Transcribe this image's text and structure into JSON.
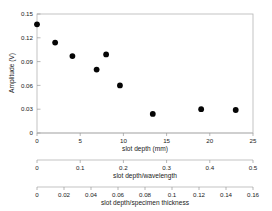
{
  "chart_data": {
    "type": "scatter",
    "title": "",
    "xlabel": "slot depth (mm)",
    "ylabel": "Amplitude (V)",
    "xlim": [
      0,
      25
    ],
    "ylim": [
      0,
      0.15
    ],
    "grid": false,
    "legend": null,
    "marker": "filled-circle",
    "marker_color": "#050505",
    "x": [
      0,
      2.1,
      4.1,
      6.9,
      8.0,
      9.6,
      13.4,
      19.0,
      23.0
    ],
    "values": [
      0.137,
      0.114,
      0.097,
      0.08,
      0.099,
      0.06,
      0.024,
      0.03,
      0.029
    ],
    "points": [
      {
        "x": 0,
        "y": 0.137
      },
      {
        "x": 2.1,
        "y": 0.114
      },
      {
        "x": 4.1,
        "y": 0.097
      },
      {
        "x": 6.9,
        "y": 0.08
      },
      {
        "x": 8.0,
        "y": 0.099
      },
      {
        "x": 9.6,
        "y": 0.06
      },
      {
        "x": 13.4,
        "y": 0.024
      },
      {
        "x": 19.0,
        "y": 0.03
      },
      {
        "x": 23.0,
        "y": 0.029
      }
    ],
    "y_ticks": [
      0,
      0.03,
      0.06,
      0.09,
      0.12,
      0.15
    ],
    "y_tick_labels": [
      "0",
      "0.03",
      "0.06",
      "0.09",
      "0.12",
      "0.15"
    ],
    "axes": [
      {
        "name": "slot-depth-mm",
        "label": "slot depth (mm)",
        "min": 0,
        "max": 25,
        "ticks": [
          0,
          5,
          10,
          15,
          20,
          25
        ],
        "tick_labels": [
          "0",
          "5",
          "10",
          "15",
          "20",
          "25"
        ]
      },
      {
        "name": "slot-depth-over-wavelength",
        "label": "slot depth/wavelength",
        "min": 0,
        "max": 0.5,
        "ticks": [
          0,
          0.1,
          0.2,
          0.3,
          0.4,
          0.5
        ],
        "tick_labels": [
          "0",
          "0.1",
          "0.2",
          "0.3",
          "0.4",
          "0.5"
        ]
      },
      {
        "name": "slot-depth-over-specimen-thickness",
        "label": "slot depth/specimen thickness",
        "min": 0,
        "max": 0.16,
        "ticks": [
          0,
          0.02,
          0.04,
          0.06,
          0.08,
          0.1,
          0.12,
          0.14,
          0.16
        ],
        "tick_labels": [
          "0",
          "0.02",
          "0.04",
          "0.06",
          "0.08",
          "0.1",
          "0.12",
          "0.14",
          "0.16"
        ]
      }
    ]
  }
}
